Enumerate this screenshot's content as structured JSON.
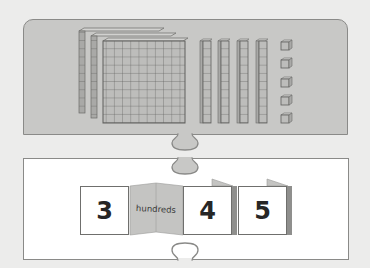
{
  "diagram": {
    "title_visible": false,
    "top_panel": {
      "description": "Base-ten blocks",
      "hundreds_blocks": 3,
      "tens_rods": 4,
      "ones_cubes": 5
    },
    "bottom_panel": {
      "cards": [
        {
          "digit": "3",
          "place_label": "hundreds"
        },
        {
          "digit": "4"
        },
        {
          "digit": "5"
        }
      ]
    },
    "colors": {
      "background": "#ececeb",
      "top_panel": "#c8c8c6",
      "block_fill": "#bdbdbb",
      "block_line": "#6b6b69",
      "card_fill": "#ffffff",
      "flap_fill": "#c4c4c2"
    }
  }
}
